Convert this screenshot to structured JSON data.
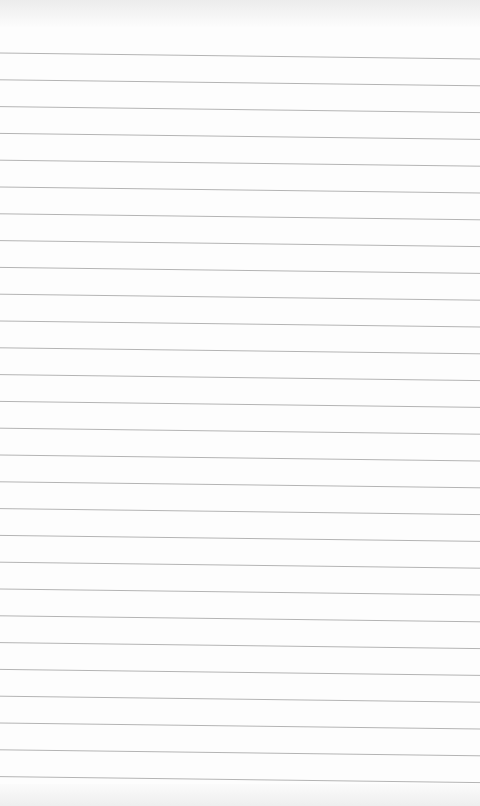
{
  "sheet": {
    "type": "lined-paper",
    "background_color": "#fdfdfd",
    "line_color": "#b4b4b4",
    "line_count": 28,
    "first_line_y_left": 53,
    "first_line_y_right": 59,
    "line_spacing": 26.8
  }
}
